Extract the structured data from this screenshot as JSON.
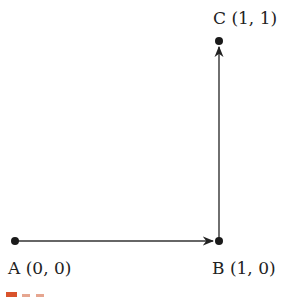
{
  "diagram": {
    "type": "vector-path",
    "points": [
      {
        "id": "A",
        "label": "A (0, 0)",
        "coords": [
          0,
          0
        ]
      },
      {
        "id": "B",
        "label": "B (1, 0)",
        "coords": [
          1,
          0
        ]
      },
      {
        "id": "C",
        "label": "C (1, 1)",
        "coords": [
          1,
          1
        ]
      }
    ],
    "edges": [
      {
        "from": "A",
        "to": "B",
        "directed": true
      },
      {
        "from": "B",
        "to": "C",
        "directed": true
      }
    ],
    "colors": {
      "line": "#333333",
      "point": "#1a1a1a",
      "caption_marker": "#d9532c"
    }
  }
}
